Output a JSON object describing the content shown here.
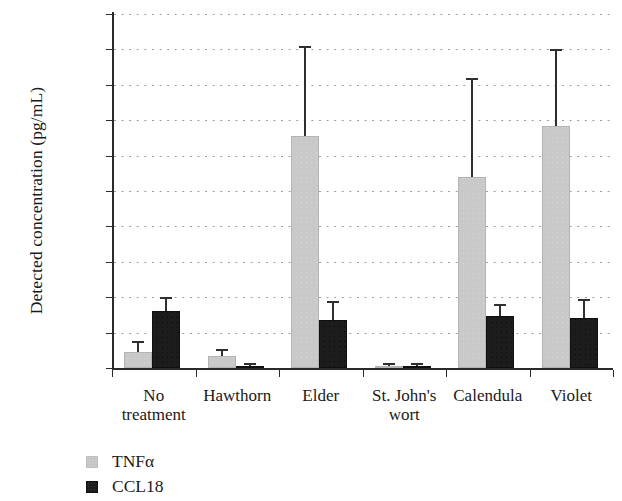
{
  "chart_data": {
    "type": "bar",
    "title": "",
    "xlabel": "",
    "ylabel": "Detected concentration (pg/mL)",
    "ylim": [
      0,
      10000
    ],
    "ytick_step": 1000,
    "yticks": [
      0,
      1000,
      2000,
      3000,
      4000,
      5000,
      6000,
      7000,
      8000,
      9000,
      10000
    ],
    "ytick_labels": [
      "0",
      "1000",
      "2000",
      "3000",
      "4000",
      "5000",
      "6000",
      "7000",
      "8000",
      "9000",
      "10000"
    ],
    "grid": "horizontal-dotted",
    "legend_position": "below-left",
    "categories": [
      "No treatment",
      "Hawthorn",
      "Elder",
      "St. John's wort",
      "Calendula",
      "Violet"
    ],
    "category_lines": [
      [
        "No",
        "treatment"
      ],
      [
        "Hawthorn",
        ""
      ],
      [
        "Elder",
        ""
      ],
      [
        "St. John's",
        "wort"
      ],
      [
        "Calendula",
        ""
      ],
      [
        "Violet",
        ""
      ]
    ],
    "series": [
      {
        "name": "TNFα",
        "color": "#c9c9c9",
        "values": [
          450,
          350,
          6550,
          30,
          5400,
          6850
        ],
        "errors_upper": [
          700,
          480,
          9050,
          60,
          8150,
          8950
        ]
      },
      {
        "name": "CCL18",
        "color": "#1c1c1c",
        "values": [
          1600,
          50,
          1370,
          40,
          1480,
          1400
        ],
        "errors_upper": [
          1950,
          90,
          1850,
          70,
          1750,
          1900
        ]
      }
    ]
  },
  "legend": {
    "items": [
      {
        "label": "TNFα",
        "swatch": "tnfa"
      },
      {
        "label": "CCL18",
        "swatch": "ccl18"
      }
    ]
  }
}
